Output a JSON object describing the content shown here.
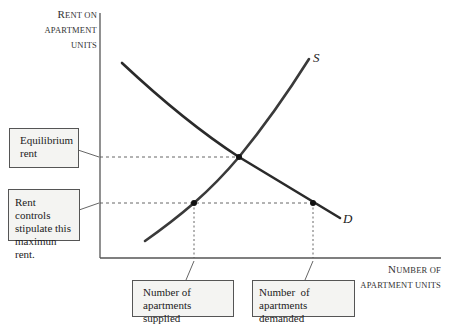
{
  "y_axis": {
    "label_line1_cap": "R",
    "label_line1_rest": "ENT ON",
    "label_line2": "APARTMENT",
    "label_line3": "UNITS"
  },
  "x_axis": {
    "label_line1_cap": "N",
    "label_line1_rest": "UMBER OF",
    "label_line2": "APARTMENT UNITS"
  },
  "curves": {
    "supply_label": "S",
    "demand_label": "D"
  },
  "callouts": {
    "equilibrium_rent": "Equilibrium rent",
    "rent_control": "Rent controls stipulate this maximun rent.",
    "quantity_supplied": "Number of apartments supplied",
    "quantity_demanded": "Number  of apartments demanded"
  },
  "colors": {
    "curve": "#2a2a2a",
    "axis": "#555555",
    "dashed": "#555555",
    "callout_fill": "#f4f4f2"
  }
}
